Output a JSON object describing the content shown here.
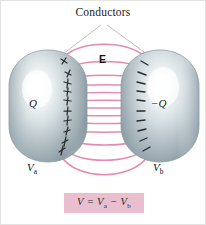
{
  "figure": {
    "title": "Conductors",
    "background_color": "#ffffff",
    "field_line_color": "#e88ab0",
    "conductor_edge_color": "#94a4ab",
    "conductor_highlight_color": "#ffffff",
    "formula_box_color": "#e9bfd0"
  },
  "labels": {
    "title": "Conductors",
    "field": "E",
    "charge_left": "Q",
    "charge_right": "−Q",
    "potential_left_main": "V",
    "potential_left_sub": "a",
    "potential_right_main": "V",
    "potential_right_sub": "b"
  },
  "formula": {
    "lhs": "V",
    "equals": "=",
    "term_a_main": "V",
    "term_a_sub": "a",
    "minus": "−",
    "term_b_main": "V",
    "term_b_sub": "b"
  },
  "conductors": [
    {
      "name": "left-conductor",
      "charge_sign": "+",
      "charge_label": "Q",
      "potential_label": "Va",
      "cx": 47,
      "cy": 105,
      "rx": 39,
      "ry": 56
    },
    {
      "name": "right-conductor",
      "charge_sign": "−",
      "charge_label": "−Q",
      "potential_label": "Vb",
      "cx": 159,
      "cy": 105,
      "rx": 39,
      "ry": 56
    }
  ],
  "field_lines": {
    "count": 13,
    "type": "electric-field-lines",
    "direction": "left-to-right",
    "description": "Pink curved field lines running from the positively charged left conductor to the negatively charged right conductor"
  },
  "surface_charges": {
    "left_plus_count": 8,
    "right_minus_count": 8
  },
  "leader_lines": {
    "description": "Two thin grey leader lines from the Conductors caption down to each conductor"
  }
}
